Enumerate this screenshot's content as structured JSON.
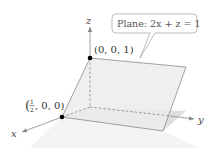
{
  "diagram": {
    "axes": {
      "x_label": "x",
      "y_label": "y",
      "z_label": "z"
    },
    "callout": {
      "text": "Plane: 2x + z = 1"
    },
    "points": [
      {
        "label": "(0, 0, 1)",
        "coords": [
          0,
          0,
          1
        ]
      },
      {
        "label_prefix": "(",
        "frac_num": "1",
        "frac_den": "2",
        "label_suffix": ", 0, 0)",
        "coords": [
          0.5,
          0,
          0
        ]
      }
    ],
    "colors": {
      "plane_fill": "#ececec",
      "plane_edge": "#8a8a8a",
      "ground_fill": "#f3f3f3",
      "shadow_fill": "#dcdcdc",
      "axis": "#888888",
      "point": "#000000",
      "callout_border": "#aaaaaa"
    }
  }
}
